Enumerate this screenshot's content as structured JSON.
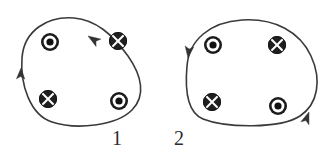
{
  "figure": {
    "background_color": "#ffffff",
    "width": 327,
    "height": 153,
    "line_color": "#3a3a3a",
    "symbol_dark": "#1c1c1c",
    "symbol_light": "#ffffff"
  },
  "loops": [
    {
      "id": "loop-1",
      "label": "1",
      "label_x": 118,
      "label_y": 140,
      "shape": "teardrop",
      "circulation": "counterclockwise",
      "path": "M 22 58 C 24 30 48 16 74 18 C 96 20 112 34 128 56 C 142 76 146 96 132 110 C 116 126 76 130 52 122 C 30 115 20 84 22 58 Z",
      "arrows": [
        {
          "name": "arrow-left-up",
          "x": 21,
          "y": 68,
          "angle": -88,
          "direction": "up"
        },
        {
          "name": "arrow-top-right",
          "x": 88,
          "y": 36,
          "angle": 213,
          "direction": "up-left"
        }
      ],
      "symbols": [
        {
          "name": "symbol-dot-top-left",
          "type": "dot",
          "meaning": "current out of page",
          "x": 50,
          "y": 42,
          "r": 9
        },
        {
          "name": "symbol-cross-top-right",
          "type": "cross",
          "meaning": "current into page",
          "x": 118,
          "y": 41,
          "r": 9
        },
        {
          "name": "symbol-cross-bottom-left",
          "type": "cross",
          "meaning": "current into page",
          "x": 48,
          "y": 99,
          "r": 9
        },
        {
          "name": "symbol-dot-bottom-right",
          "type": "dot",
          "meaning": "current out of page",
          "x": 119,
          "y": 101,
          "r": 9
        }
      ]
    },
    {
      "id": "loop-2",
      "label": "2",
      "label_x": 180,
      "label_y": 140,
      "shape": "rounded-blob",
      "circulation": "counterclockwise",
      "path": "M 187 66 C 189 40 210 22 242 20 C 275 18 300 32 311 56 C 322 80 318 104 300 116 C 280 129 226 128 203 119 C 186 112 185 88 187 66 Z",
      "arrows": [
        {
          "name": "arrow-left-down",
          "x": 188,
          "y": 58,
          "angle": 97,
          "direction": "down"
        },
        {
          "name": "arrow-right-up",
          "x": 309,
          "y": 112,
          "angle": -70,
          "direction": "up"
        }
      ],
      "symbols": [
        {
          "name": "symbol-dot-top-left",
          "type": "dot",
          "meaning": "current out of page",
          "x": 213,
          "y": 45,
          "r": 9
        },
        {
          "name": "symbol-cross-top-right",
          "type": "cross",
          "meaning": "current into page",
          "x": 277,
          "y": 45,
          "r": 9
        },
        {
          "name": "symbol-cross-bottom-left",
          "type": "cross",
          "meaning": "current into page",
          "x": 212,
          "y": 102,
          "r": 9
        },
        {
          "name": "symbol-dot-bottom-right",
          "type": "dot",
          "meaning": "current out of page",
          "x": 278,
          "y": 106,
          "r": 9
        }
      ]
    }
  ]
}
